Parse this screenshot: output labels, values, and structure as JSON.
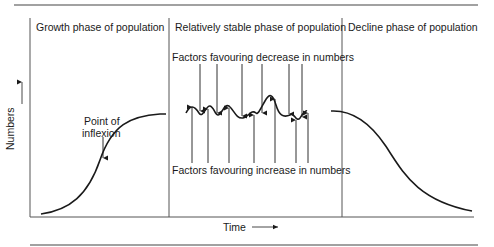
{
  "diagram": {
    "phases": [
      {
        "label": "Growth phase of population"
      },
      {
        "label": "Relatively stable phase of population"
      },
      {
        "label": "Decline phase of population"
      }
    ],
    "annotations": {
      "decrease_factors": "Factors favouring decrease in numbers",
      "increase_factors": "Factors favouring increase in numbers",
      "inflexion_line1": "Point of",
      "inflexion_line2": "inflexion"
    },
    "axes": {
      "y_label": "Numbers",
      "x_label": "Time"
    },
    "colors": {
      "line": "#1a1a1a",
      "rule": "#444444",
      "background": "#ffffff"
    }
  }
}
